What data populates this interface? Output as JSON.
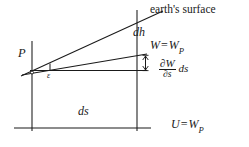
{
  "figure": {
    "background_color": "#ffffff",
    "line_color": "#1a1a1a",
    "width": 249,
    "height": 147
  },
  "labels": {
    "earth_surface": "earth's surface",
    "dh": "dh",
    "level_surface_w": "W",
    "level_surface_equals": "=",
    "level_surface_wp": "W",
    "level_surface_wp_sub": "P",
    "point_p": "P",
    "epsilon": "ε",
    "partial_numerator": "∂W",
    "partial_denominator": "∂s",
    "partial_tail": "ds",
    "ds": "ds",
    "geoid_u": "U",
    "geoid_equals": "=",
    "geoid_wp": "W",
    "geoid_wp_sub": "P"
  },
  "geometry": {
    "left_vertical_x": 32,
    "right_vertical_x": 137,
    "baseline_y": 128,
    "point_p_y": 72,
    "earth_surface_end": [
      162,
      11
    ],
    "level_surface_end": [
      146,
      54
    ],
    "horizontal_ref_y": 70,
    "dh_arrow_top": 46,
    "dh_arrow_bottom": 70
  }
}
